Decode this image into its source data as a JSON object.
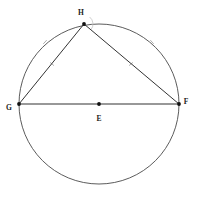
{
  "figure": {
    "type": "euclidean-geometry-diagram",
    "background_color": "#ffffff",
    "stroke_color": "#4a4a4a",
    "chord_color": "#333333",
    "point_color": "#111111",
    "tick_color": "#9a9a9a",
    "width": 198,
    "height": 200
  },
  "circle": {
    "name": "circumscribed-circle",
    "center_label": "E",
    "cx": 99,
    "cy": 104,
    "r": 80,
    "stroke_width": 0.9
  },
  "points": [
    {
      "id": "H",
      "label": "H",
      "x": 84,
      "y": 24,
      "label_x": 81,
      "label_y": 15,
      "dot_r": 1.9,
      "on_circle": true
    },
    {
      "id": "G",
      "label": "G",
      "x": 19,
      "y": 104,
      "label_x": 9,
      "label_y": 110,
      "dot_r": 1.9,
      "on_circle": true
    },
    {
      "id": "F",
      "label": "F",
      "x": 179,
      "y": 104,
      "label_x": 186,
      "label_y": 104,
      "dot_r": 1.9,
      "on_circle": true
    },
    {
      "id": "E",
      "label": "E",
      "x": 99,
      "y": 104,
      "label_x": 99,
      "label_y": 121,
      "dot_r": 1.9,
      "on_circle": false
    }
  ],
  "segments": [
    {
      "id": "GF",
      "name": "diameter-g-f",
      "from": "G",
      "to": "F",
      "x1": 19,
      "y1": 104,
      "x2": 179,
      "y2": 104,
      "stroke_width": 1.1
    },
    {
      "id": "GH",
      "name": "chord-g-h",
      "from": "G",
      "to": "H",
      "x1": 19,
      "y1": 104,
      "x2": 84,
      "y2": 24,
      "stroke_width": 1.0
    },
    {
      "id": "HF",
      "name": "chord-h-f",
      "from": "H",
      "to": "F",
      "x1": 84,
      "y1": 24,
      "x2": 179,
      "y2": 104,
      "stroke_width": 1.0
    }
  ],
  "arc_ticks": [
    {
      "id": "tick-arc-gh",
      "name": "arc-tick-left",
      "x": 45,
      "y": 42,
      "angle": -48,
      "length": 5
    },
    {
      "id": "tick-arc-hf",
      "name": "arc-tick-right",
      "x": 152,
      "y": 42,
      "angle": 48,
      "length": 5
    }
  ],
  "chord_ticks": [
    {
      "id": "tick-gh",
      "name": "chord-tick-left",
      "x": 52,
      "y": 64,
      "angle": 40,
      "length": 5
    },
    {
      "id": "tick-hf",
      "name": "chord-tick-right",
      "x": 131,
      "y": 64,
      "angle": -40,
      "length": 5
    }
  ],
  "angle_marks": [
    {
      "id": "angle-H",
      "name": "angle-arc-at-h",
      "vertex": "H",
      "cx": 84,
      "cy": 24,
      "r": 9,
      "start_deg": 309,
      "end_deg": 40
    }
  ],
  "labels": {
    "h": "H",
    "g": "G",
    "f": "F",
    "e": "E"
  }
}
